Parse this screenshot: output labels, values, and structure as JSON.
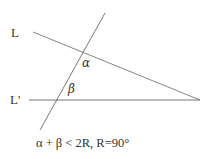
{
  "diagram": {
    "line_L_label": "L",
    "line_Lprime_label": "L'",
    "angle_alpha": "α",
    "angle_beta": "β",
    "formula": "α + β < 2R, R=90°",
    "line_color": "#555555"
  }
}
